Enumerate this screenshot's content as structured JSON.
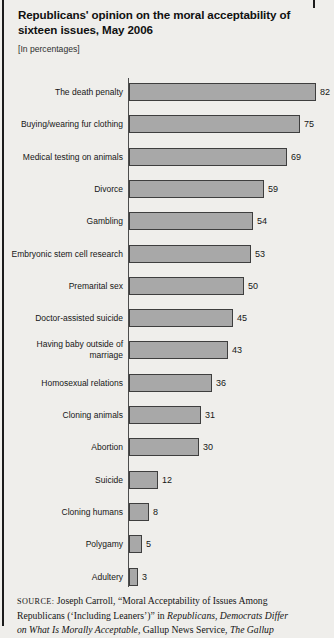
{
  "page": {
    "title": "Republicans' opinion on the moral acceptability of sixteen issues, May 2006",
    "subtitle": "[In percentages]"
  },
  "chart_data": {
    "type": "bar",
    "orientation": "horizontal",
    "title": "Republicans' opinion on the moral acceptability of sixteen issues, May 2006",
    "subtitle": "[In percentages]",
    "unit": "percent",
    "categories": [
      "The death penalty",
      "Buying/wearing fur clothing",
      "Medical testing on animals",
      "Divorce",
      "Gambling",
      "Embryonic stem cell research",
      "Premarital sex",
      "Doctor-assisted suicide",
      "Having baby outside of marriage",
      "Homosexual relations",
      "Cloning animals",
      "Abortion",
      "Suicide",
      "Cloning humans",
      "Polygamy",
      "Adultery"
    ],
    "values": [
      82,
      75,
      69,
      59,
      54,
      53,
      50,
      45,
      43,
      36,
      31,
      30,
      12,
      8,
      5,
      3
    ],
    "xlabel": "",
    "ylabel": "",
    "xlim": [
      0,
      90
    ],
    "grid": false,
    "legend": false,
    "value_labels_shown": true,
    "bar_color": "#a8a8a8",
    "bar_border_color": "#3e3e3e",
    "axis_color": "#4d4d4d"
  },
  "source": {
    "lines": [
      {
        "segments": [
          {
            "t": "SOURCE:",
            "style": "smallcaps"
          },
          {
            "t": " Joseph Carroll, “Moral Acceptability of Issues Among",
            "style": "normal"
          }
        ]
      },
      {
        "segments": [
          {
            "t": "Republicans (‘Including Leaners’)” in ",
            "style": "normal"
          },
          {
            "t": "Republicans, Democrats Differ",
            "style": "italic"
          }
        ]
      },
      {
        "segments": [
          {
            "t": "on What Is Morally Acceptable,",
            "style": "italic"
          },
          {
            "t": " Gallup News Service, ",
            "style": "normal"
          },
          {
            "t": "The Gallup",
            "style": "italic"
          }
        ]
      }
    ]
  }
}
